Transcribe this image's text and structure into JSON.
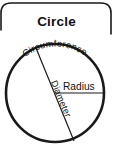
{
  "figure": {
    "title": "Circle",
    "background_color": "#ffffff",
    "ink_color": "#1a1a1a",
    "labels": {
      "circumference": "Circumference",
      "diameter": "Diameter",
      "radius": "Radius"
    },
    "geometry": {
      "center_x": 55,
      "center_y": 93,
      "radius": 49,
      "diameter_start_x": 36,
      "diameter_start_y": 48,
      "diameter_end_x": 74,
      "diameter_end_y": 141,
      "radius_end_x": 104,
      "radius_end_y": 93
    }
  }
}
